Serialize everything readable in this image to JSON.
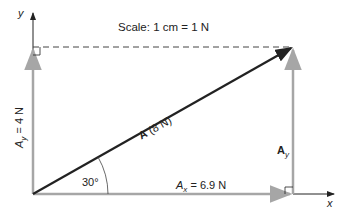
{
  "title": "Scale: 1 cm = 1 N",
  "axes": {
    "x_label": "x",
    "y_label": "y"
  },
  "vectors": {
    "A": {
      "name": "A",
      "magnitude": "(8 N)"
    },
    "Ax": {
      "name": "A",
      "sub": "x",
      "value": "= 6.9 N"
    },
    "Ay_left": {
      "name": "A",
      "sub": "y",
      "value": "= 4 N"
    },
    "Ay_right": {
      "name": "A",
      "sub": "y"
    }
  },
  "angle": "30°",
  "colors": {
    "resultant": "#222222",
    "component": "#a6a6a6",
    "axis": "#222222"
  }
}
